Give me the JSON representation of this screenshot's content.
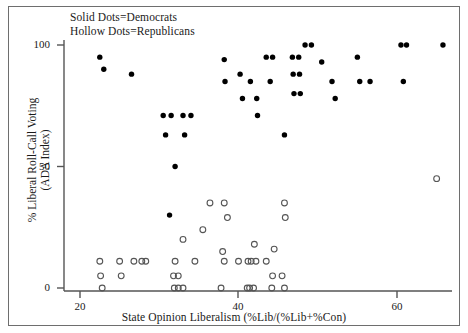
{
  "figure": {
    "background_color": "#ffffff",
    "border_color": "#6e6e6e",
    "point_color": "#000000"
  },
  "legend": {
    "line1": "Solid Dots=Democrats",
    "line2": "Hollow Dots=Republicans"
  },
  "axes": {
    "x_title": "State Opinion Liberalism (%Lib/(%Lib+%Con)",
    "y_title_line1": "% Liberal Roll-Call Voting",
    "y_title_line2": "(ADA Index)",
    "x_ticks": [
      "20",
      "40",
      "60"
    ],
    "y_ticks": [
      "100",
      "50",
      "0"
    ]
  },
  "chart_data": {
    "type": "scatter",
    "title": "",
    "xlabel": "State Opinion Liberalism (%Lib/(%Lib+%Con)",
    "ylabel": "% Liberal Roll-Call Voting (ADA Index)",
    "xlim": [
      18.5,
      67.5
    ],
    "ylim": [
      -4,
      106
    ],
    "xticks": [
      20,
      40,
      60
    ],
    "yticks": [
      0,
      50,
      100
    ],
    "grid": false,
    "legend_position": "top-left-inside",
    "series": [
      {
        "name": "Democrats",
        "marker": "solid-dot",
        "color": "#000000",
        "points": [
          [
            22.5,
            95
          ],
          [
            23.0,
            90
          ],
          [
            26.5,
            88
          ],
          [
            30.5,
            71
          ],
          [
            31.5,
            71
          ],
          [
            33.0,
            71
          ],
          [
            34.0,
            71
          ],
          [
            30.8,
            63
          ],
          [
            33.2,
            63
          ],
          [
            32.0,
            50
          ],
          [
            31.3,
            30
          ],
          [
            38.2,
            94
          ],
          [
            38.3,
            85
          ],
          [
            40.2,
            88
          ],
          [
            40.5,
            78
          ],
          [
            41.5,
            85
          ],
          [
            42.3,
            78
          ],
          [
            42.4,
            71
          ],
          [
            43.5,
            95
          ],
          [
            44.3,
            95
          ],
          [
            44.0,
            85
          ],
          [
            45.8,
            63
          ],
          [
            46.8,
            95
          ],
          [
            47.6,
            95
          ],
          [
            46.9,
            88
          ],
          [
            47.7,
            88
          ],
          [
            47.0,
            80
          ],
          [
            47.8,
            80
          ],
          [
            48.4,
            100
          ],
          [
            49.2,
            100
          ],
          [
            50.5,
            93
          ],
          [
            51.8,
            85
          ],
          [
            52.2,
            78
          ],
          [
            55.0,
            95
          ],
          [
            55.3,
            85
          ],
          [
            56.6,
            85
          ],
          [
            60.5,
            100
          ],
          [
            61.2,
            100
          ],
          [
            60.8,
            85
          ],
          [
            65.8,
            100
          ]
        ]
      },
      {
        "name": "Republicans",
        "marker": "hollow-dot",
        "color": "#555555",
        "points": [
          [
            22.5,
            11
          ],
          [
            22.6,
            5
          ],
          [
            22.8,
            0
          ],
          [
            25.0,
            11
          ],
          [
            25.2,
            5
          ],
          [
            26.8,
            11
          ],
          [
            27.8,
            11
          ],
          [
            28.3,
            11
          ],
          [
            32.0,
            11
          ],
          [
            31.8,
            5
          ],
          [
            32.4,
            5
          ],
          [
            31.9,
            0
          ],
          [
            32.4,
            0
          ],
          [
            33.0,
            0
          ],
          [
            34.5,
            11
          ],
          [
            33.0,
            20
          ],
          [
            35.5,
            24
          ],
          [
            36.4,
            35
          ],
          [
            38.2,
            35
          ],
          [
            38.6,
            29
          ],
          [
            38.0,
            15
          ],
          [
            38.2,
            11
          ],
          [
            37.8,
            0
          ],
          [
            40.0,
            11
          ],
          [
            41.2,
            11
          ],
          [
            41.6,
            11
          ],
          [
            42.2,
            11
          ],
          [
            41.1,
            0
          ],
          [
            41.4,
            0
          ],
          [
            41.9,
            0
          ],
          [
            43.5,
            11
          ],
          [
            42.0,
            18
          ],
          [
            45.8,
            35
          ],
          [
            45.9,
            29
          ],
          [
            44.5,
            16
          ],
          [
            44.3,
            5
          ],
          [
            45.5,
            5
          ],
          [
            44.2,
            0
          ],
          [
            45.8,
            0
          ],
          [
            65.0,
            45
          ]
        ]
      }
    ]
  }
}
